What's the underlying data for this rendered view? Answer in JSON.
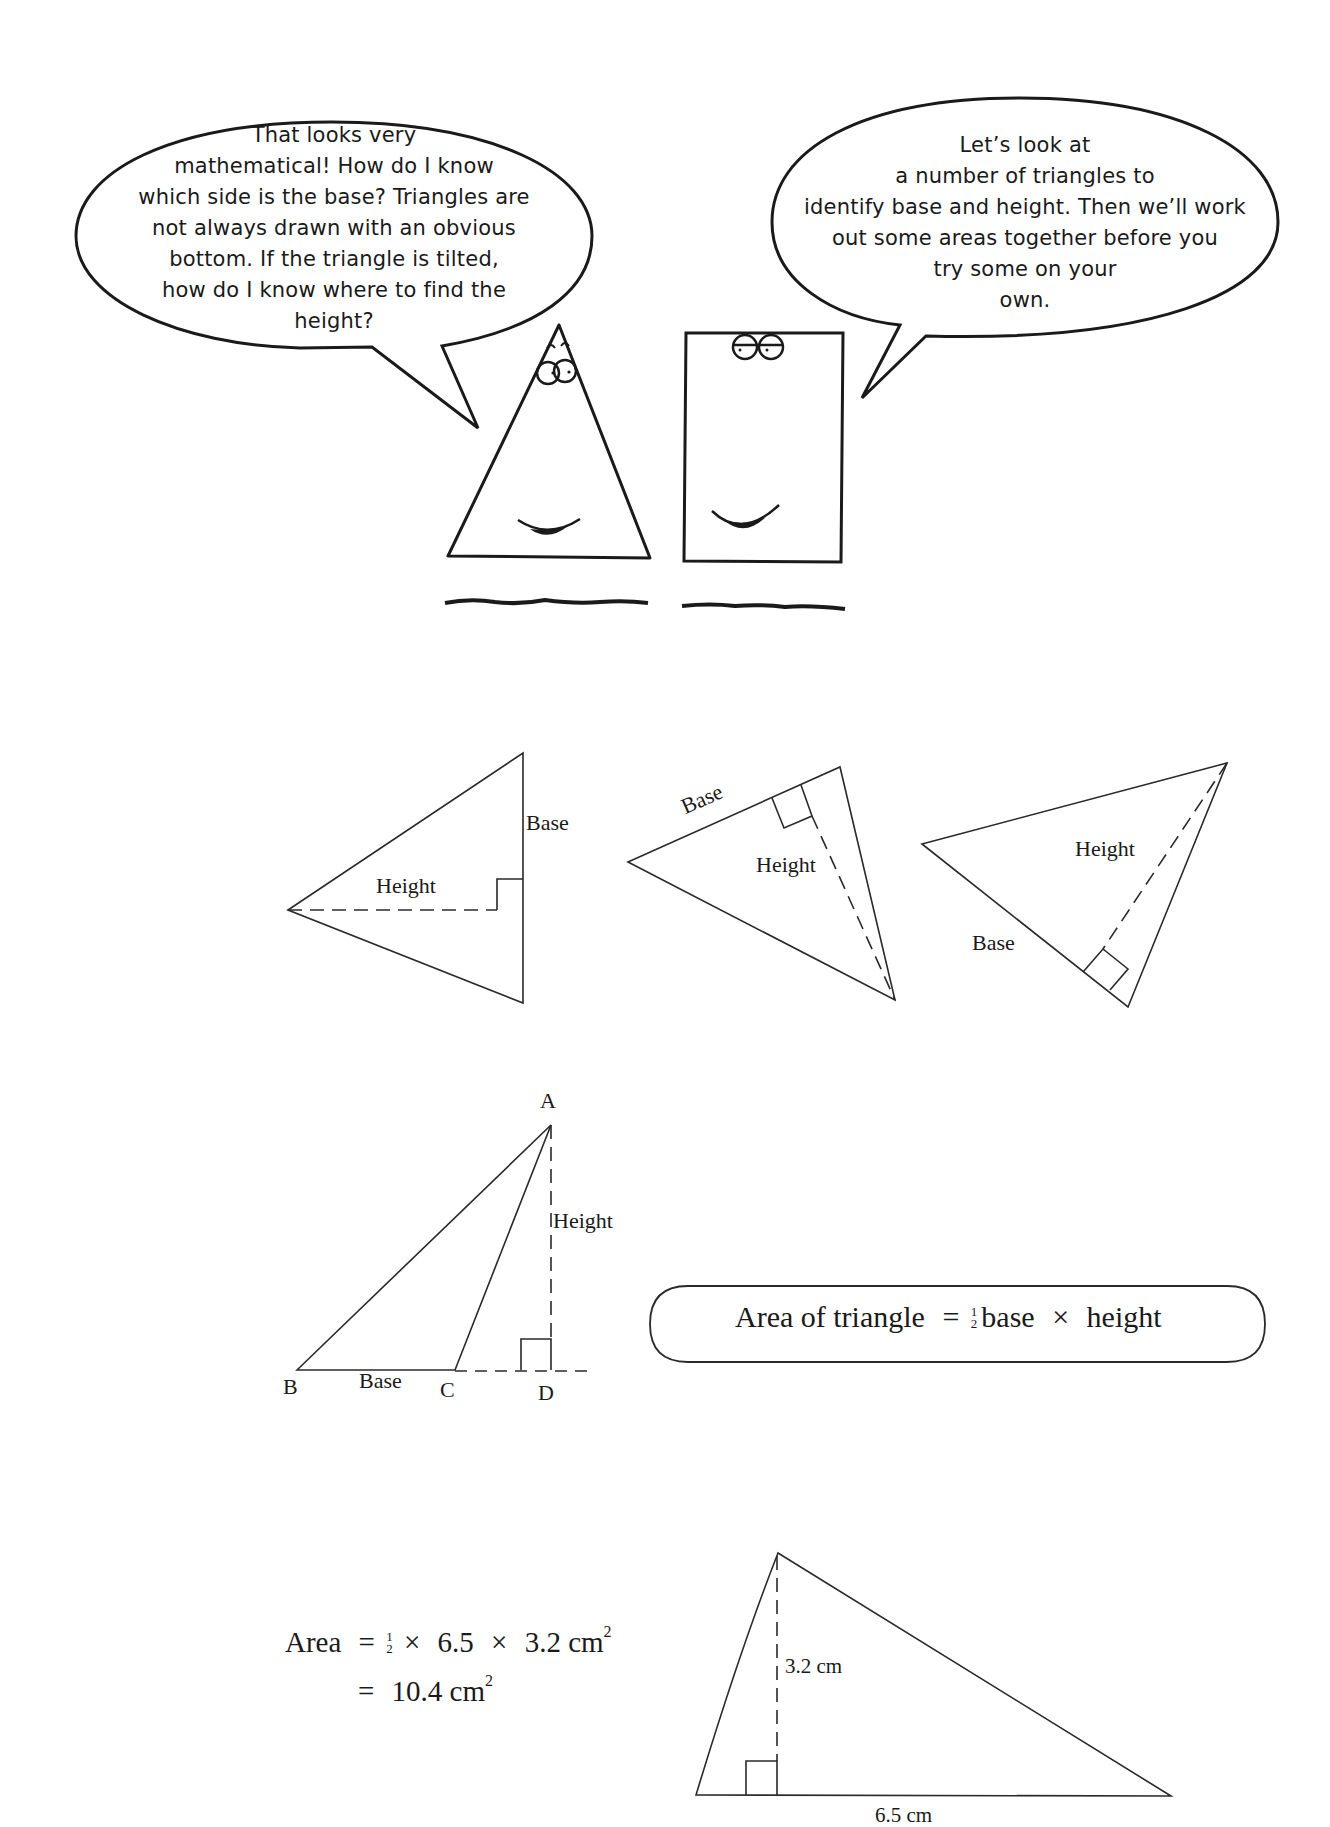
{
  "dialogue": {
    "triangle_character_bubble": {
      "lines": [
        "That looks very",
        "mathematical! How do I know",
        "which side is the base? Triangles are",
        "not always drawn with an obvious",
        "bottom. If the triangle is tilted,",
        "how do I know where to find the",
        "height?"
      ]
    },
    "rectangle_character_bubble": {
      "lines": [
        "Let’s look at",
        "a number of triangles to",
        "identify base and height. Then we’ll work",
        "out some areas together before you",
        "try some on your",
        "own."
      ]
    }
  },
  "examples": {
    "triangle_1": {
      "base_label": "Base",
      "height_label": "Height"
    },
    "triangle_2": {
      "base_label": "Base",
      "height_label": "Height"
    },
    "triangle_3": {
      "base_label": "Base",
      "height_label": "Height"
    }
  },
  "obtuse_triangle": {
    "vertex_a": "A",
    "vertex_b": "B",
    "vertex_c": "C",
    "vertex_d": "D",
    "base_label": "Base",
    "height_label": "Height"
  },
  "formula_box": {
    "lhs": "Area of triangle",
    "equals": "=",
    "frac_num": "1",
    "frac_den": "2",
    "term1": "base",
    "times": "×",
    "term2": "height"
  },
  "worked_example": {
    "line1": {
      "lhs": "Area",
      "equals": "=",
      "frac_num": "1",
      "frac_den": "2",
      "times": "×",
      "base": "6.5",
      "height": "3.2",
      "unit": "cm",
      "exp": "2"
    },
    "line2": {
      "equals": "=",
      "result": "10.4",
      "unit": "cm",
      "exp": "2"
    },
    "triangle": {
      "height_label": "3.2 cm",
      "base_label": "6.5 cm"
    }
  },
  "colors": {
    "ink": "#1a1a1a",
    "paper": "#ffffff"
  }
}
